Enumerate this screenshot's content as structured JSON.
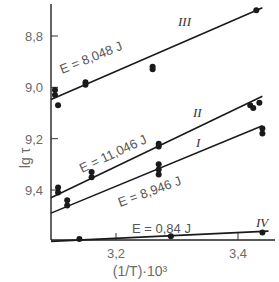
{
  "chart_data": {
    "type": "scatter",
    "title": "",
    "xlabel": "(1/T)·10³",
    "ylabel": "lg τ",
    "xlim": [
      3.09,
      3.47
    ],
    "ylim": [
      9.6,
      8.62
    ],
    "y_inverted": true,
    "grid": false,
    "x_ticks": [
      {
        "value": 3.2,
        "label": "3,2"
      },
      {
        "value": 3.4,
        "label": "3,4"
      }
    ],
    "y_ticks": [
      {
        "value": 8.8,
        "label": "8,8"
      },
      {
        "value": 9.0,
        "label": "9,0"
      },
      {
        "value": 9.2,
        "label": "9,2"
      },
      {
        "value": 9.4,
        "label": "9,4"
      }
    ],
    "series": [
      {
        "name": "III",
        "energy_label": "E = 8,048 J",
        "line": {
          "x": [
            3.09,
            3.44
          ],
          "y": [
            9.047,
            8.69
          ]
        },
        "points": [
          {
            "x": 3.1,
            "y": 9.01
          },
          {
            "x": 3.1,
            "y": 9.03
          },
          {
            "x": 3.105,
            "y": 9.07
          },
          {
            "x": 3.15,
            "y": 8.98
          },
          {
            "x": 3.15,
            "y": 8.99
          },
          {
            "x": 3.26,
            "y": 8.92
          },
          {
            "x": 3.26,
            "y": 8.93
          },
          {
            "x": 3.43,
            "y": 8.7
          }
        ]
      },
      {
        "name": "II",
        "energy_label": "E = 11,046 J",
        "line": {
          "x": [
            3.09,
            3.44
          ],
          "y": [
            9.43,
            9.035
          ]
        },
        "points": [
          {
            "x": 3.105,
            "y": 9.39
          },
          {
            "x": 3.105,
            "y": 9.41
          },
          {
            "x": 3.16,
            "y": 9.33
          },
          {
            "x": 3.16,
            "y": 9.35
          },
          {
            "x": 3.27,
            "y": 9.22
          },
          {
            "x": 3.27,
            "y": 9.23
          },
          {
            "x": 3.42,
            "y": 9.07
          },
          {
            "x": 3.425,
            "y": 9.08
          },
          {
            "x": 3.435,
            "y": 9.06
          }
        ]
      },
      {
        "name": "I",
        "energy_label": "E = 8,946 J",
        "line": {
          "x": [
            3.09,
            3.44
          ],
          "y": [
            9.49,
            9.15
          ]
        },
        "points": [
          {
            "x": 3.12,
            "y": 9.44
          },
          {
            "x": 3.12,
            "y": 9.46
          },
          {
            "x": 3.27,
            "y": 9.3
          },
          {
            "x": 3.27,
            "y": 9.32
          },
          {
            "x": 3.27,
            "y": 9.34
          },
          {
            "x": 3.44,
            "y": 9.16
          },
          {
            "x": 3.44,
            "y": 9.18
          }
        ]
      },
      {
        "name": "IV",
        "energy_label": "E = 0,84 J",
        "line": {
          "x": [
            3.09,
            3.45
          ],
          "y": [
            9.6,
            9.56
          ]
        },
        "points": [
          {
            "x": 3.14,
            "y": 9.595
          },
          {
            "x": 3.29,
            "y": 9.58
          },
          {
            "x": 3.44,
            "y": 9.565
          }
        ]
      }
    ]
  }
}
